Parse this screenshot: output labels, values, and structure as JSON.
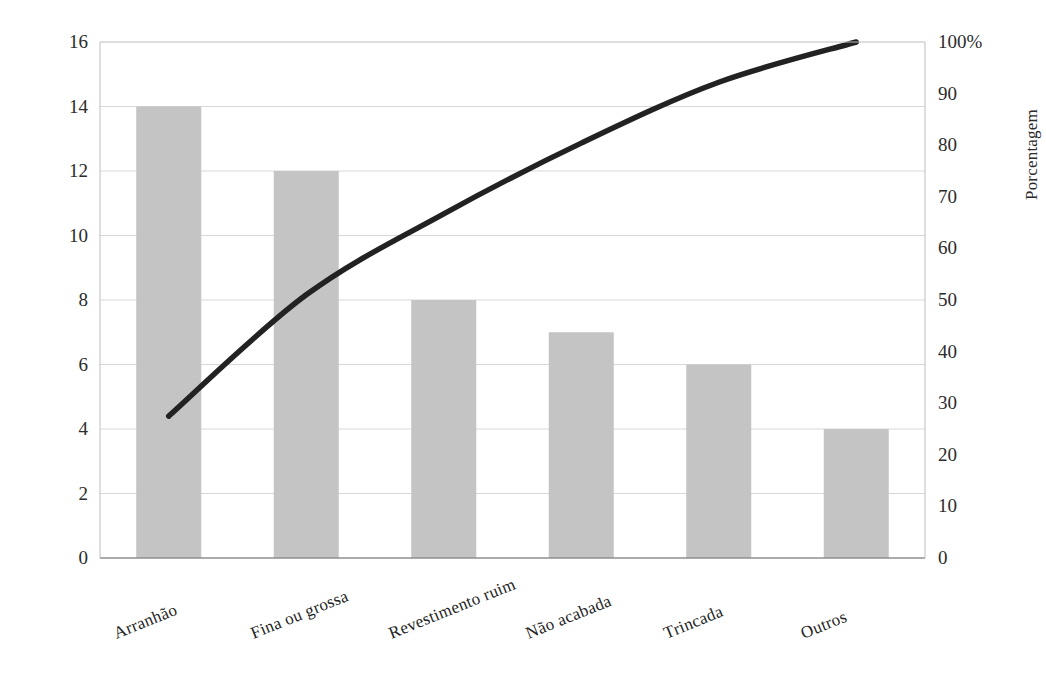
{
  "chart_data": {
    "type": "bar",
    "title": "",
    "subtitle": "",
    "categories": [
      "Arranhão",
      "Fina ou grossa",
      "Revestimento ruim",
      "Não acabada",
      "Trincada",
      "Outros"
    ],
    "values": [
      14,
      12,
      8,
      7,
      6,
      4
    ],
    "cumulative_percent": [
      27.5,
      51.0,
      66.7,
      80.4,
      92.2,
      100.0
    ],
    "total": 51,
    "xlabel": "",
    "ylabel": "Quantidade",
    "y2label": "Porcentagem",
    "ylim": [
      0,
      16
    ],
    "y2lim": [
      0,
      100
    ],
    "yticks": [
      "16",
      "14",
      "12",
      "10",
      "8",
      "6",
      "4",
      "2",
      "0"
    ],
    "ytick_values": [
      16,
      14,
      12,
      10,
      8,
      6,
      4,
      2,
      0
    ],
    "y2ticks": [
      "100%",
      "90",
      "80",
      "70",
      "60",
      "50",
      "40",
      "30",
      "20",
      "10",
      "0"
    ],
    "y2tick_values": [
      100,
      90,
      80,
      70,
      60,
      50,
      40,
      30,
      20,
      10,
      0
    ],
    "grid": true,
    "legend": "none",
    "series": [
      {
        "name": "Quantidade",
        "type": "bar",
        "values": [
          14,
          12,
          8,
          7,
          6,
          4
        ],
        "color": "#c4c4c4"
      },
      {
        "name": "Porcentagem acumulada",
        "type": "line",
        "values": [
          27.5,
          51.0,
          66.7,
          80.4,
          92.2,
          100.0
        ],
        "color": "#222222"
      }
    ],
    "colors": {
      "bar_fill": "#c4c4c4",
      "line": "#222222",
      "grid": "#d8d8d8",
      "axis": "#bdbdbd",
      "text": "#2b2b2b",
      "background": "#ffffff"
    }
  }
}
